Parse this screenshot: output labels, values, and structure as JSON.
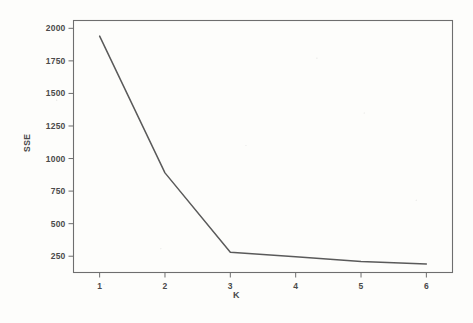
{
  "figure": {
    "background_color": "#fdfdfb",
    "ink_color": "#5a5a5a",
    "frame_color": "#6e6e6e",
    "y_axis_title": "SSE",
    "x_axis_title": "K"
  },
  "chart_data": {
    "type": "line",
    "title": "",
    "subtitle": "",
    "xlabel": "K",
    "ylabel": "SSE",
    "x": [
      1,
      2,
      3,
      4,
      5,
      6
    ],
    "values": [
      1940,
      890,
      280,
      245,
      210,
      190
    ],
    "series": [
      {
        "name": "SSE",
        "values": [
          1940,
          890,
          280,
          245,
          210,
          190
        ],
        "color": "#5a5a5a"
      }
    ],
    "xlim": [
      0.6,
      6.4
    ],
    "ylim": [
      125,
      2060
    ],
    "xticks": [
      1,
      2,
      3,
      4,
      5,
      6
    ],
    "xtick_labels": [
      "1",
      "2",
      "3",
      "4",
      "5",
      "6"
    ],
    "yticks": [
      250,
      500,
      750,
      1000,
      1250,
      1500,
      1750,
      2000
    ],
    "ytick_labels": [
      "250",
      "500",
      "750",
      "1000",
      "1250",
      "1500",
      "1750",
      "2000"
    ],
    "grid": false,
    "legend": false,
    "legend_position": "none",
    "markers": false,
    "annotations": []
  }
}
